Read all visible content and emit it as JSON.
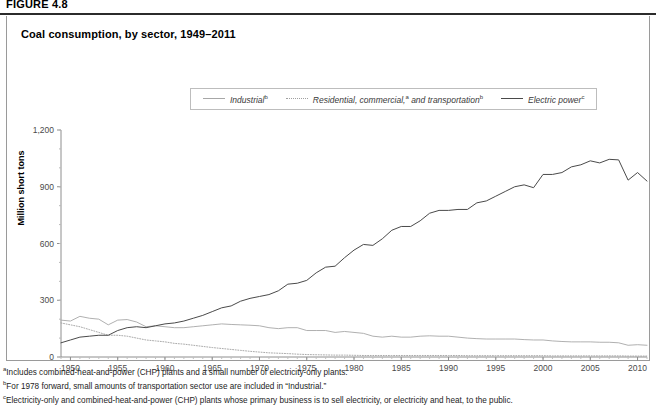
{
  "figure": {
    "number": "FIGURE 4.8"
  },
  "card": {
    "title": "Coal consumption, by sector, 1949–2011"
  },
  "legend": {
    "items": [
      {
        "label": "Industrial",
        "marker": "b",
        "style": "solid-light",
        "color": "#a7a7a7",
        "icon": "line-swatch-icon"
      },
      {
        "label": "Residential, commercial, and transportation",
        "marker": "",
        "style": "dotted",
        "color": "#a0a0a0",
        "icon": "dotted-line-swatch-icon"
      },
      {
        "label": "Electric power",
        "marker": "c",
        "style": "solid-dark",
        "color": "#4a4a4a",
        "icon": "line-swatch-icon"
      }
    ],
    "residential_markers": {
      "commercial": "a",
      "transportation": "b"
    }
  },
  "footnotes": [
    {
      "marker": "a",
      "text": "Includes combined-heat-and-power (CHP) plants and a small number of electricity-only plants."
    },
    {
      "marker": "b",
      "text": "For 1978 forward, small amounts of transportation sector use are included in “Industrial.”"
    },
    {
      "marker": "c",
      "text": "Electricity-only and combined-heat-and-power (CHP) plants whose primary business is to sell electricity, or electricity and heat, to the public."
    }
  ],
  "chart_data": {
    "type": "line",
    "title": "Coal consumption, by sector, 1949–2011",
    "xlabel": "",
    "ylabel": "Million short tons",
    "xlim": [
      1949,
      2011
    ],
    "ylim": [
      0,
      1200
    ],
    "yticks": [
      0,
      300,
      600,
      900,
      1200
    ],
    "ytick_labels": [
      "0",
      "300",
      "600",
      "900",
      "1,200"
    ],
    "xticks": [
      1950,
      1955,
      1960,
      1965,
      1970,
      1975,
      1980,
      1985,
      1990,
      1995,
      2000,
      2005,
      2010
    ],
    "grid": false,
    "legend_position": "top-center",
    "x": [
      1949,
      1950,
      1951,
      1952,
      1953,
      1954,
      1955,
      1956,
      1957,
      1958,
      1959,
      1960,
      1961,
      1962,
      1963,
      1964,
      1965,
      1966,
      1967,
      1968,
      1969,
      1970,
      1971,
      1972,
      1973,
      1974,
      1975,
      1976,
      1977,
      1978,
      1979,
      1980,
      1981,
      1982,
      1983,
      1984,
      1985,
      1986,
      1987,
      1988,
      1989,
      1990,
      1991,
      1992,
      1993,
      1994,
      1995,
      1996,
      1997,
      1998,
      1999,
      2000,
      2001,
      2002,
      2003,
      2004,
      2005,
      2006,
      2007,
      2008,
      2009,
      2010,
      2011
    ],
    "series": [
      {
        "name": "Industrial",
        "style": "solid-light",
        "color": "#a7a7a7",
        "values": [
          195,
          190,
          215,
          205,
          200,
          170,
          195,
          198,
          185,
          160,
          165,
          160,
          155,
          155,
          160,
          165,
          170,
          175,
          172,
          170,
          168,
          165,
          155,
          150,
          155,
          155,
          140,
          140,
          140,
          130,
          135,
          130,
          125,
          110,
          105,
          110,
          105,
          105,
          110,
          112,
          110,
          110,
          105,
          100,
          97,
          95,
          95,
          95,
          95,
          92,
          90,
          90,
          85,
          82,
          80,
          80,
          80,
          78,
          78,
          75,
          62,
          65,
          62
        ]
      },
      {
        "name": "Residential, commercial, and transportation",
        "style": "dotted",
        "color": "#a0a0a0",
        "values": [
          180,
          170,
          160,
          145,
          130,
          115,
          115,
          110,
          100,
          90,
          85,
          80,
          72,
          68,
          62,
          56,
          50,
          45,
          40,
          35,
          30,
          26,
          22,
          20,
          18,
          15,
          13,
          12,
          11,
          10,
          10,
          9,
          8,
          8,
          8,
          8,
          8,
          8,
          8,
          8,
          8,
          8,
          8,
          7,
          7,
          7,
          7,
          7,
          7,
          7,
          7,
          7,
          6,
          6,
          6,
          6,
          6,
          6,
          6,
          6,
          5,
          5,
          5
        ]
      },
      {
        "name": "Electric power",
        "style": "solid-dark",
        "color": "#4a4a4a",
        "values": [
          75,
          90,
          105,
          110,
          115,
          115,
          140,
          155,
          160,
          155,
          165,
          175,
          180,
          190,
          205,
          220,
          240,
          260,
          270,
          295,
          310,
          320,
          330,
          350,
          385,
          390,
          405,
          445,
          475,
          480,
          525,
          565,
          595,
          590,
          625,
          670,
          690,
          690,
          720,
          760,
          775,
          775,
          780,
          780,
          815,
          825,
          850,
          875,
          900,
          910,
          895,
          965,
          965,
          975,
          1005,
          1016,
          1037,
          1026,
          1045,
          1042,
          935,
          975,
          930
        ]
      }
    ]
  }
}
